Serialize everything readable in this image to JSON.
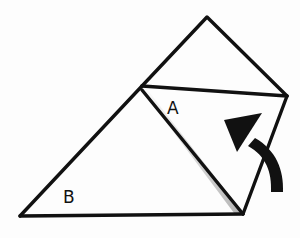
{
  "diagram": {
    "type": "origami-fold-step",
    "labels": {
      "flap_a": "A",
      "flap_b": "B"
    },
    "colors": {
      "ink": "#111111",
      "paper": "#fdfdfd",
      "shadow": "#888888"
    },
    "arrow": {
      "meaning": "fold flap up and over",
      "direction": "up-left"
    }
  }
}
